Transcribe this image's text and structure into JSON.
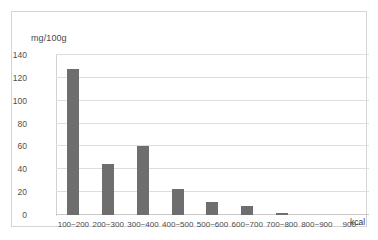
{
  "chart_data": {
    "type": "bar",
    "title": "",
    "xlabel": "kcal",
    "ylabel": "mg/100g",
    "categories": [
      "100~200",
      "200~300",
      "300~400",
      "400~500",
      "500~600",
      "600~700",
      "700~800",
      "800~900",
      "900~"
    ],
    "values": [
      128,
      45,
      60,
      23,
      11,
      8,
      2,
      0,
      0
    ],
    "ylim": [
      0,
      140
    ],
    "yticks": [
      0,
      20,
      40,
      60,
      80,
      100,
      120,
      140
    ],
    "grid": true,
    "legend": false,
    "bar_color": "#6e6e6e",
    "grid_color": "#dededf",
    "border_color": "#d5d5d5"
  },
  "axes": {
    "y_unit_label": "mg/100g",
    "x_unit_label": "kcal",
    "y_tick_labels": [
      "0",
      "20",
      "40",
      "60",
      "80",
      "100",
      "120",
      "140"
    ],
    "x_tick_labels": [
      "100~200",
      "200~300",
      "300~400",
      "400~500",
      "500~600",
      "600~700",
      "700~800",
      "800~900",
      "900~"
    ]
  }
}
